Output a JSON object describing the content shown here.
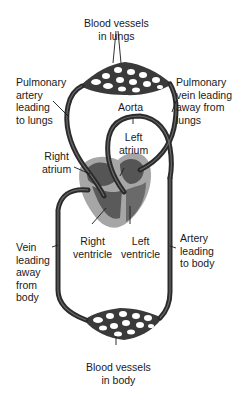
{
  "diagram": {
    "colors": {
      "vessel": "#2b2b2b",
      "vessel_highlight": "#6a6a6a",
      "heart_outer": "#a6a6a6",
      "heart_inner": "#555555",
      "capillary_fill": "#3a3a3a",
      "text": "#1a1a1a"
    },
    "labels": {
      "lung_vessels": "Blood vessels\nin lungs",
      "pulmonary_artery": "Pulmonary\nartery\nleading\nto lungs",
      "pulmonary_vein": "Pulmonary\nvein leading\naway from\nlungs",
      "aorta": "Aorta",
      "left_atrium": "Left\natrium",
      "right_atrium": "Right\natrium",
      "right_ventricle": "Right\nventricle",
      "left_ventricle": "Left\nventricle",
      "vein_from_body": "Vein\nleading\naway\nfrom\nbody",
      "artery_to_body": "Artery\nleading\nto body",
      "body_vessels": "Blood vessels\nin body"
    }
  }
}
